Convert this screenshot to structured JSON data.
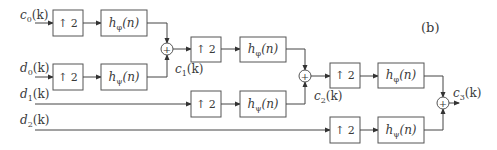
{
  "figure": {
    "panel_label": "(b)"
  },
  "inputs": [
    {
      "name": "c",
      "sub": "0",
      "arg": "(k)"
    },
    {
      "name": "d",
      "sub": "0",
      "arg": "(k)"
    },
    {
      "name": "d",
      "sub": "1",
      "arg": "(k)"
    },
    {
      "name": "d",
      "sub": "2",
      "arg": "(k)"
    }
  ],
  "outputs": [
    {
      "name": "c",
      "sub": "1",
      "arg": "(k)"
    },
    {
      "name": "c",
      "sub": "2",
      "arg": "(k)"
    },
    {
      "name": "c",
      "sub": "3",
      "arg": "(k)"
    }
  ],
  "blocks": {
    "upsampler": "↑ 2",
    "scaling_filter": {
      "h": "h",
      "sub": "φ",
      "arg": "(n)"
    },
    "wavelet_filter": {
      "h": "h",
      "sub": "ψ",
      "arg": "(n)"
    },
    "adder": "+"
  },
  "colors": {
    "line": "#444444",
    "box_border": "#555555",
    "text": "#3a3a3a",
    "background": "#ffffff"
  }
}
